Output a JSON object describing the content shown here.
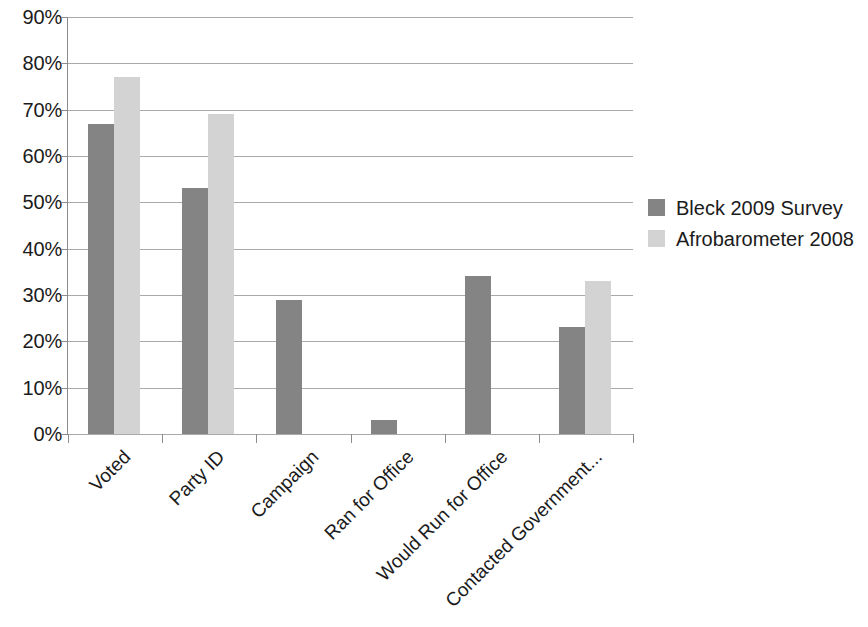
{
  "chart_data": {
    "type": "bar",
    "title": "",
    "subtitle": "",
    "xlabel": "",
    "ylabel": "",
    "ylim": [
      0,
      90
    ],
    "ytick_labels": [
      "0%",
      "10%",
      "20%",
      "30%",
      "40%",
      "50%",
      "60%",
      "70%",
      "80%",
      "90%"
    ],
    "ytick_values": [
      0,
      10,
      20,
      30,
      40,
      50,
      60,
      70,
      80,
      90
    ],
    "grid": true,
    "legend_position": "right",
    "categories": [
      "Voted",
      "Party ID",
      "Campaign",
      "Ran for Office",
      "Would Run for Office",
      "Contacted Government..."
    ],
    "series": [
      {
        "name": "Bleck 2009 Survey",
        "color": "#848484",
        "values": [
          67,
          53,
          29,
          3,
          34,
          23
        ]
      },
      {
        "name": "Afrobarometer 2008",
        "color": "#d3d3d3",
        "values": [
          77,
          69,
          null,
          null,
          null,
          33
        ]
      }
    ],
    "value_unit": "%"
  },
  "legend": {
    "items": [
      {
        "label": "Bleck 2009 Survey",
        "swatch": "dark"
      },
      {
        "label": "Afrobarometer 2008",
        "swatch": "light"
      }
    ]
  },
  "colors": {
    "series_dark": "#848484",
    "series_light": "#d3d3d3",
    "gridline": "#a9a9a9",
    "axis": "#8c8c8c",
    "text": "#1b1b1b",
    "background": "#ffffff"
  }
}
